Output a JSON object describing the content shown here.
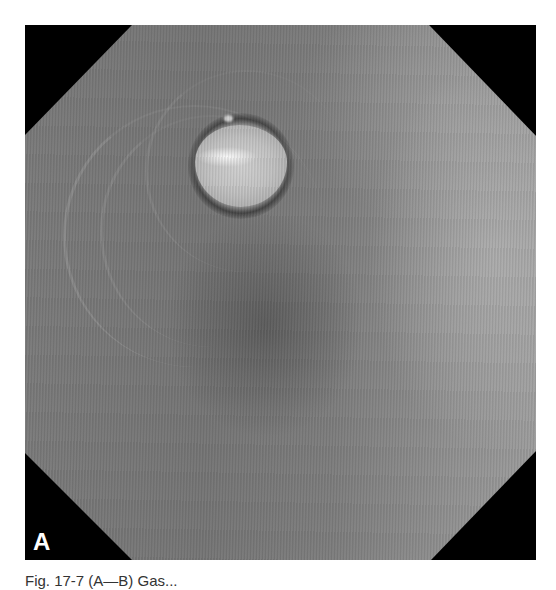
{
  "figure": {
    "panel_label": "A",
    "colors": {
      "frame_corners": "#000000",
      "mucosa_dark": "#6f6f6f",
      "mucosa_mid": "#7e7e7e",
      "mucosa_light": "#9a9a9a",
      "lesion": "#c8c8c8",
      "label": "#ffffff"
    }
  },
  "caption": {
    "text": "Fig. 17-7 (A—B) Gas..."
  }
}
